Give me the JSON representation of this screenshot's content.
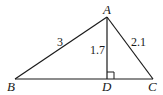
{
  "diagram": {
    "type": "triangle-with-altitude",
    "vertices": {
      "A": {
        "label": "A",
        "x": 107,
        "y": 17
      },
      "B": {
        "label": "B",
        "x": 15,
        "y": 79
      },
      "C": {
        "label": "C",
        "x": 153,
        "y": 79
      },
      "D": {
        "label": "D",
        "x": 107,
        "y": 79
      }
    },
    "segments": [
      {
        "from": "A",
        "to": "B",
        "length_label": "3"
      },
      {
        "from": "A",
        "to": "C",
        "length_label": "2.1"
      },
      {
        "from": "A",
        "to": "D",
        "length_label": "1.7"
      },
      {
        "from": "B",
        "to": "C",
        "length_label": ""
      }
    ],
    "right_angle_at": "D",
    "labels": {
      "A": "A",
      "B": "B",
      "C": "C",
      "D": "D",
      "AB": "3",
      "AD": "1.7",
      "AC": "2.1"
    },
    "stroke_color": "#1a1a1a"
  }
}
